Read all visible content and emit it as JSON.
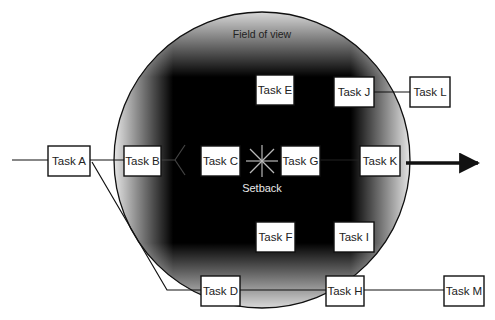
{
  "diagram": {
    "field_label": "Field of view",
    "setback_label": "Setback",
    "colors": {
      "box_fill": "#ffffff",
      "box_stroke": "#111111",
      "field_center": "#000000",
      "field_edge": "#ffffff",
      "arrow": "#111111"
    },
    "tasks": [
      {
        "id": "A",
        "label": "Task A"
      },
      {
        "id": "B",
        "label": "Task B"
      },
      {
        "id": "C",
        "label": "Task C"
      },
      {
        "id": "D",
        "label": "Task D"
      },
      {
        "id": "E",
        "label": "Task E"
      },
      {
        "id": "F",
        "label": "Task F"
      },
      {
        "id": "G",
        "label": "Task G"
      },
      {
        "id": "H",
        "label": "Task H"
      },
      {
        "id": "I",
        "label": "Task I"
      },
      {
        "id": "J",
        "label": "Task J"
      },
      {
        "id": "K",
        "label": "Task K"
      },
      {
        "id": "L",
        "label": "Task L"
      },
      {
        "id": "M",
        "label": "Task M"
      }
    ],
    "connections": [
      {
        "from": "A",
        "to": "B"
      },
      {
        "from": "A",
        "to": "D"
      },
      {
        "from": "B",
        "to": "C"
      },
      {
        "from": "G",
        "to": "K"
      },
      {
        "from": "J",
        "to": "L"
      },
      {
        "from": "D",
        "to": "H"
      },
      {
        "from": "H",
        "to": "M"
      }
    ]
  }
}
